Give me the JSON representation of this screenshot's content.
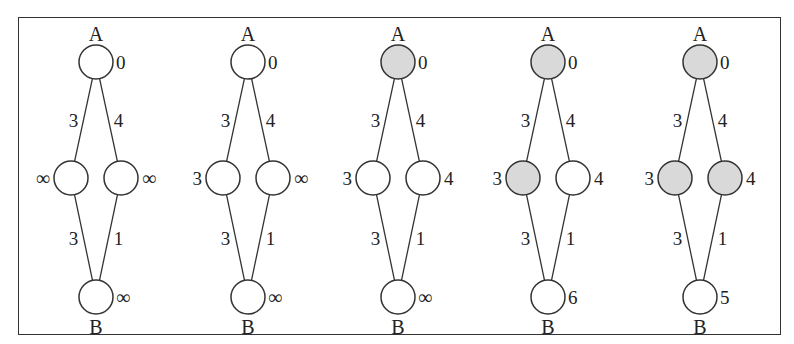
{
  "figure": {
    "node_fill_default": "#ffffff",
    "node_fill_visited": "#d9d9d9",
    "stroke_color": "#333333",
    "panels": [
      {
        "id": 1,
        "nodes": {
          "A": {
            "label": "A",
            "dist": "0",
            "visited": false
          },
          "L": {
            "dist": "∞",
            "visited": false
          },
          "R": {
            "dist": "∞",
            "visited": false
          },
          "B": {
            "label": "B",
            "dist": "∞",
            "visited": false
          }
        },
        "edges": {
          "A_L": "3",
          "A_R": "4",
          "L_B": "3",
          "R_B": "1"
        }
      },
      {
        "id": 2,
        "nodes": {
          "A": {
            "label": "A",
            "dist": "0",
            "visited": false
          },
          "L": {
            "dist": "3",
            "visited": false
          },
          "R": {
            "dist": "∞",
            "visited": false
          },
          "B": {
            "label": "B",
            "dist": "∞",
            "visited": false
          }
        },
        "edges": {
          "A_L": "3",
          "A_R": "4",
          "L_B": "3",
          "R_B": "1"
        }
      },
      {
        "id": 3,
        "nodes": {
          "A": {
            "label": "A",
            "dist": "0",
            "visited": true
          },
          "L": {
            "dist": "3",
            "visited": false
          },
          "R": {
            "dist": "4",
            "visited": false
          },
          "B": {
            "label": "B",
            "dist": "∞",
            "visited": false
          }
        },
        "edges": {
          "A_L": "3",
          "A_R": "4",
          "L_B": "3",
          "R_B": "1"
        }
      },
      {
        "id": 4,
        "nodes": {
          "A": {
            "label": "A",
            "dist": "0",
            "visited": true
          },
          "L": {
            "dist": "3",
            "visited": true
          },
          "R": {
            "dist": "4",
            "visited": false
          },
          "B": {
            "label": "B",
            "dist": "6",
            "visited": false
          }
        },
        "edges": {
          "A_L": "3",
          "A_R": "4",
          "L_B": "3",
          "R_B": "1"
        }
      },
      {
        "id": 5,
        "nodes": {
          "A": {
            "label": "A",
            "dist": "0",
            "visited": true
          },
          "L": {
            "dist": "3",
            "visited": true
          },
          "R": {
            "dist": "4",
            "visited": true
          },
          "B": {
            "label": "B",
            "dist": "5",
            "visited": false
          }
        },
        "edges": {
          "A_L": "3",
          "A_R": "4",
          "L_B": "3",
          "R_B": "1"
        }
      }
    ]
  }
}
